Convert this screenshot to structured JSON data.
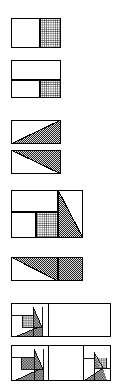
{
  "page": {
    "width": 122,
    "height": 389,
    "background": "#ffffff",
    "stroke_color": "#000000",
    "figure_count": 8
  },
  "patterns": {
    "grid": {
      "name": "grid-hatch",
      "description": "dense square grid / cross-hatch fill",
      "line_color": "#000000",
      "background": "#ffffff",
      "spacing": 2
    },
    "checker": {
      "name": "checker-dot",
      "description": "fine checkerboard / dotted halftone fill",
      "dot_color": "#2a2a2a",
      "background": "#d8d8d8",
      "spacing": 2
    },
    "solid_white": {
      "name": "plain-white",
      "description": "unfilled white region",
      "fill": "#ffffff"
    }
  },
  "figures": [
    {
      "id": "figure-1",
      "label": "Figure 1",
      "x": 11,
      "y": 18,
      "w": 50,
      "h": 30,
      "caption": "Rectangle split vertically: white left part, grid-hatched right part",
      "regions": [
        {
          "name": "white-left-block",
          "fill": "solid_white",
          "shape": "rect",
          "x": 0,
          "y": 0,
          "w": 29,
          "h": 30
        },
        {
          "name": "grid-right-block",
          "fill": "grid",
          "shape": "rect",
          "x": 29,
          "y": 0,
          "w": 21,
          "h": 30
        }
      ]
    },
    {
      "id": "figure-2",
      "label": "Figure 2",
      "x": 11,
      "y": 60,
      "w": 50,
      "h": 38,
      "caption": "Rectangle with white top band; lower band split into white left and grid-hatched right",
      "regions": [
        {
          "name": "white-top-band",
          "fill": "solid_white",
          "shape": "rect",
          "x": 0,
          "y": 0,
          "w": 50,
          "h": 20
        },
        {
          "name": "white-lower-left",
          "fill": "solid_white",
          "shape": "rect",
          "x": 0,
          "y": 20,
          "w": 29,
          "h": 18
        },
        {
          "name": "grid-lower-right",
          "fill": "grid",
          "shape": "rect",
          "x": 29,
          "y": 20,
          "w": 21,
          "h": 18
        }
      ]
    },
    {
      "id": "figure-3",
      "label": "Figure 3",
      "x": 11,
      "y": 120,
      "w": 50,
      "h": 24,
      "caption": "Rectangle with lower-right triangle checker-shaded, diagonal from bottom-left to top-right",
      "regions": [
        {
          "name": "white-upper-triangle",
          "fill": "solid_white",
          "shape": "triangle",
          "points": "0,0 50,0 0,24"
        },
        {
          "name": "checker-lower-triangle",
          "fill": "checker",
          "shape": "triangle",
          "points": "50,0 50,24 0,24"
        }
      ]
    },
    {
      "id": "figure-4",
      "label": "Figure 4",
      "x": 11,
      "y": 150,
      "w": 50,
      "h": 24,
      "caption": "Rectangle with upper-left-to-right triangle checker-shaded above the diagonal",
      "regions": [
        {
          "name": "checker-upper-triangle",
          "fill": "checker",
          "shape": "triangle",
          "points": "0,0 50,0 50,24"
        },
        {
          "name": "white-lower-triangle",
          "fill": "solid_white",
          "shape": "triangle",
          "points": "0,0 50,24 0,24"
        }
      ]
    },
    {
      "id": "figure-5",
      "label": "Figure 5",
      "x": 11,
      "y": 190,
      "w": 72,
      "h": 48,
      "caption": "Composite rectangle: white top band, white lower-left block, grid-hatched square, checker triangle on right",
      "regions": [
        {
          "name": "white-top-band",
          "fill": "solid_white",
          "shape": "rect",
          "x": 0,
          "y": 0,
          "w": 47,
          "h": 22
        },
        {
          "name": "white-lower-left-block",
          "fill": "solid_white",
          "shape": "rect",
          "x": 0,
          "y": 22,
          "w": 25,
          "h": 26
        },
        {
          "name": "grid-centre-square",
          "fill": "grid",
          "shape": "rect",
          "x": 25,
          "y": 22,
          "w": 22,
          "h": 26
        },
        {
          "name": "checker-right-triangle",
          "fill": "checker",
          "shape": "triangle",
          "points": "47,0 47,48 72,48"
        },
        {
          "name": "white-top-right-triangle",
          "fill": "solid_white",
          "shape": "triangle",
          "points": "47,0 72,0 72,48"
        }
      ]
    },
    {
      "id": "figure-6",
      "label": "Figure 6",
      "x": 11,
      "y": 257,
      "w": 72,
      "h": 24,
      "caption": "Rectangle: left part upper triangle checker-shaded over white, right part fully checker-shaded",
      "regions": [
        {
          "name": "checker-left-upper-triangle",
          "fill": "checker",
          "shape": "triangle",
          "points": "0,0 47,0 47,24"
        },
        {
          "name": "white-left-lower-triangle",
          "fill": "solid_white",
          "shape": "triangle",
          "points": "0,0 47,24 0,24"
        },
        {
          "name": "checker-right-block",
          "fill": "checker",
          "shape": "rect",
          "x": 47,
          "y": 0,
          "w": 25,
          "h": 24
        }
      ]
    },
    {
      "id": "figure-7",
      "label": "Figure 7",
      "x": 11,
      "y": 303,
      "w": 100,
      "h": 34,
      "caption": "Wide rectangle with a small recursive dissection cluster at the left and a large white region to the right",
      "regions": [
        {
          "name": "recursive-cluster-left",
          "fill": "mixed",
          "shape": "group",
          "x": 0,
          "y": 0,
          "w": 37,
          "h": 34
        },
        {
          "name": "white-right-region",
          "fill": "solid_white",
          "shape": "rect",
          "x": 37,
          "y": 0,
          "w": 63,
          "h": 34
        }
      ]
    },
    {
      "id": "figure-8",
      "label": "Figure 8",
      "x": 11,
      "y": 345,
      "w": 100,
      "h": 36,
      "caption": "Wide rectangle with recursive dissection clusters at both the left and the right ends, white centre",
      "regions": [
        {
          "name": "recursive-cluster-left",
          "fill": "mixed",
          "shape": "group",
          "x": 0,
          "y": 0,
          "w": 37,
          "h": 36
        },
        {
          "name": "white-centre-region",
          "fill": "solid_white",
          "shape": "rect",
          "x": 37,
          "y": 0,
          "w": 35,
          "h": 36
        },
        {
          "name": "recursive-cluster-right",
          "fill": "mixed",
          "shape": "group",
          "x": 72,
          "y": 0,
          "w": 28,
          "h": 36
        }
      ]
    }
  ]
}
